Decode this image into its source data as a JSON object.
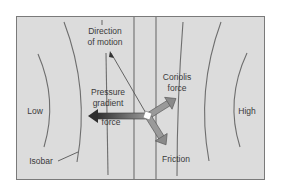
{
  "diagram": {
    "labels": {
      "direction_of_motion": "Direction\nof motion",
      "direction_line1": "Direction",
      "direction_line2": "of motion",
      "coriolis_line1": "Coriolis",
      "coriolis_line2": "force",
      "pressure_line1": "Pressure",
      "pressure_line2": "gradient",
      "pressure_line3": "force",
      "friction": "Friction",
      "low": "Low",
      "high": "High",
      "isobar": "Isobar"
    },
    "colors": {
      "background": "#dcdcdc",
      "frame_border": "#7a7a7a",
      "isobar_line": "#6e6e6e",
      "pressure_arrow": "#555555",
      "coriolis_arrow": "#8f8f8f",
      "friction_arrow": "#8f8f8f",
      "text": "#3a3a3a"
    }
  }
}
